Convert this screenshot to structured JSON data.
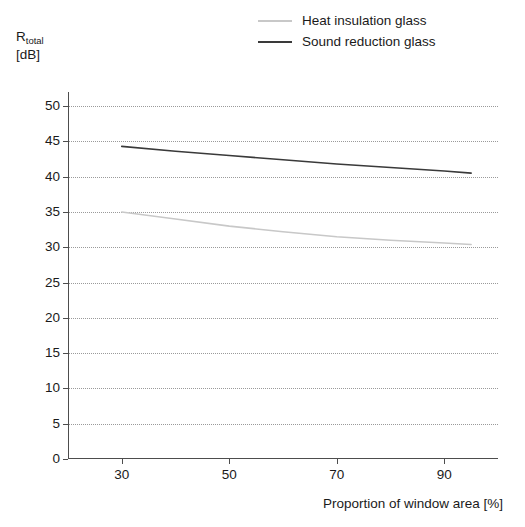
{
  "chart_data": {
    "type": "line",
    "title": "",
    "subtitle": "",
    "xlabel": "Proportion of window area [%]",
    "ylabel": "R_total [dB]",
    "ylabel_main": "R",
    "ylabel_sub": "total",
    "ylabel_unit": "[dB]",
    "xlim": [
      20,
      100
    ],
    "ylim": [
      0,
      52
    ],
    "x_ticks": [
      30,
      50,
      70,
      90
    ],
    "x_tick_labels": [
      "30",
      "50",
      "70",
      "90"
    ],
    "y_ticks": [
      0,
      5,
      10,
      15,
      20,
      25,
      30,
      35,
      40,
      45,
      50
    ],
    "y_tick_labels": [
      "0",
      "5",
      "10",
      "15",
      "20",
      "25",
      "30",
      "35",
      "40",
      "45",
      "50"
    ],
    "grid": "horizontal-dotted",
    "legend_position": "top-right",
    "x": [
      30,
      40,
      50,
      60,
      70,
      80,
      90,
      95
    ],
    "series": [
      {
        "name": "Heat insulation glass",
        "color": "#c8c8c8",
        "values": [
          35.0,
          34.0,
          33.0,
          32.2,
          31.5,
          31.0,
          30.6,
          30.4
        ]
      },
      {
        "name": "Sound reduction glass",
        "color": "#3a3a3a",
        "values": [
          44.3,
          43.6,
          43.0,
          42.4,
          41.8,
          41.3,
          40.8,
          40.5
        ]
      }
    ]
  },
  "legend": {
    "items": [
      {
        "label": "Heat insulation glass",
        "color": "#c8c8c8"
      },
      {
        "label": "Sound reduction glass",
        "color": "#3a3a3a"
      }
    ]
  }
}
